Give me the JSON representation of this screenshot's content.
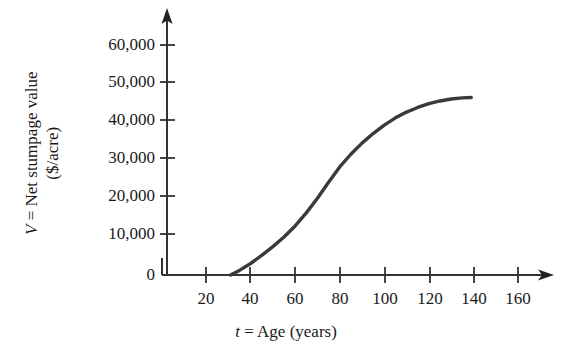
{
  "chart_data": {
    "type": "line",
    "title": "",
    "subtitle": "",
    "xlabel_plain": "t = Age (years)",
    "xlabel_var": "t",
    "xlabel_rest": " = Age (years)",
    "ylabel_plain": "V = Net stumpage value ($/acre)",
    "ylabel_var": "V",
    "ylabel_line1_rest": " = Net stumpage value",
    "ylabel_line2": "($/acre)",
    "xlim": [
      0,
      170
    ],
    "ylim": [
      0,
      65000
    ],
    "grid": false,
    "legend": "none",
    "x_ticks": [
      20,
      40,
      60,
      80,
      100,
      120,
      140,
      160
    ],
    "x_tick_labels": [
      "20",
      "40",
      "60",
      "80",
      "100",
      "120",
      "140",
      "160"
    ],
    "y_ticks": [
      0,
      10000,
      20000,
      30000,
      40000,
      50000,
      60000
    ],
    "y_tick_labels": [
      "0",
      "10,000",
      "20,000",
      "30,000",
      "40,000",
      "50,000",
      "60,000"
    ],
    "series": [
      {
        "name": "Net stumpage value",
        "color": "#3a3a3a",
        "x": [
          31,
          35,
          40,
          45,
          50,
          55,
          60,
          65,
          70,
          75,
          80,
          85,
          90,
          95,
          100,
          105,
          110,
          115,
          120,
          125,
          130,
          135,
          139
        ],
        "values": [
          0,
          1200,
          3000,
          5100,
          7400,
          9900,
          12800,
          16200,
          20000,
          24200,
          28200,
          31500,
          34400,
          36900,
          39100,
          41000,
          42500,
          43700,
          44700,
          45400,
          45900,
          46200,
          46300
        ]
      }
    ],
    "axis_color": "#333333",
    "curve_color": "#3a3a3a",
    "background_color": "#ffffff"
  },
  "axis_geometry": {
    "origin_x": 162,
    "origin_y": 275,
    "x_tick_pixels": [
      206,
      250,
      295,
      340,
      385,
      430,
      474,
      518
    ],
    "y_tick_pixels": [
      275,
      234,
      196,
      158,
      120,
      82,
      45
    ],
    "y_axis_x": 167,
    "y_axis_top": 10,
    "x_axis_right": 552
  }
}
